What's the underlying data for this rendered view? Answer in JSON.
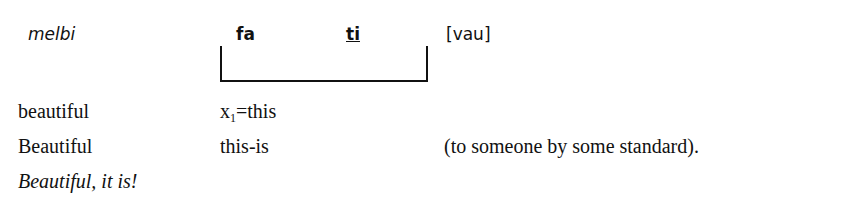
{
  "gloss": {
    "row1": {
      "word": "melbi",
      "parts": [
        "fa",
        "ti"
      ],
      "bracket_label": "[vau]"
    },
    "row2": {
      "col1": "beautiful",
      "col2_var": "x",
      "col2_sub": "1",
      "col2_rest": "=this"
    },
    "row3": {
      "col1": "Beautiful",
      "col2": "this-is",
      "col3": "(to someone by some standard)."
    },
    "row4": {
      "translation": "Beautiful, it is!"
    }
  }
}
